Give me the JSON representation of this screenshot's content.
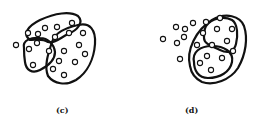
{
  "panels": [
    {
      "id": "c",
      "label": "(c)",
      "points": [
        [
          16,
          45
        ],
        [
          28,
          33
        ],
        [
          38,
          34
        ],
        [
          45,
          28
        ],
        [
          57,
          27
        ],
        [
          72,
          23
        ],
        [
          37,
          43
        ],
        [
          29,
          49
        ],
        [
          49,
          51
        ],
        [
          55,
          37
        ],
        [
          69,
          33
        ],
        [
          83,
          33
        ],
        [
          79,
          45
        ],
        [
          64,
          51
        ],
        [
          85,
          54
        ],
        [
          59,
          61
        ],
        [
          75,
          62
        ],
        [
          33,
          65
        ],
        [
          53,
          69
        ],
        [
          64,
          75
        ]
      ],
      "clusters": [
        "M30,40 C22,34 28,26 40,20 C55,13 70,11 78,16 C84,22 78,30 68,34 C60,38 54,44 48,42 C42,38 36,40 30,40 Z",
        "M24,48 C22,40 32,37 40,38 C48,38 54,44 55,52 C55,60 48,66 40,70 C32,74 26,70 25,62 C24,56 24,52 24,48 Z",
        "M52,42 C55,32 66,28 78,25 C90,22 96,30 95,44 C94,58 88,72 76,80 C66,86 54,84 48,76 C44,66 48,54 52,42 Z"
      ]
    },
    {
      "id": "d",
      "label": "(d)",
      "points": [
        [
          163,
          39
        ],
        [
          176,
          27
        ],
        [
          185,
          29
        ],
        [
          193,
          23
        ],
        [
          206,
          22
        ],
        [
          220,
          18
        ],
        [
          177,
          43
        ],
        [
          184,
          37
        ],
        [
          203,
          33
        ],
        [
          217,
          29
        ],
        [
          232,
          29
        ],
        [
          180,
          59
        ],
        [
          197,
          45
        ],
        [
          212,
          45
        ],
        [
          227,
          41
        ],
        [
          233,
          51
        ],
        [
          207,
          56
        ],
        [
          222,
          58
        ],
        [
          200,
          63
        ],
        [
          211,
          70
        ]
      ],
      "clusters": [
        "M206,26 C212,18 224,16 232,20 C238,24 238,36 236,44 C234,52 228,54 220,50 C212,46 204,44 204,38 C204,32 204,30 206,26 Z",
        "M194,62 C192,52 200,46 212,46 C224,46 234,52 232,62 C230,72 220,78 208,78 C198,78 194,70 194,62 Z",
        "M190,66 C186,50 196,30 212,20 C226,12 240,16 244,26 C248,38 246,54 238,68 C230,80 214,86 202,82 C194,78 191,72 190,66 Z"
      ]
    }
  ]
}
